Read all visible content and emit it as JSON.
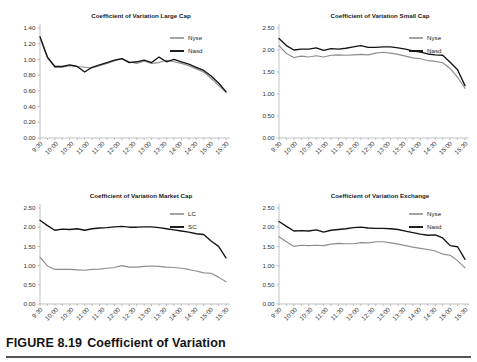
{
  "figure": {
    "caption_label": "FIGURE 8.19",
    "caption_title": "Coefficient of Variation"
  },
  "common": {
    "x_tick_labels": [
      "9:30",
      "10:00",
      "10:30",
      "11:00",
      "11:30",
      "12:00",
      "12:30",
      "13:00",
      "13:30",
      "14:00",
      "14:30",
      "15:00",
      "15:30"
    ],
    "colors": {
      "gray_series": "#8d8d8d",
      "black_series": "#141414",
      "axis": "#9a9a9a",
      "text": "#1a1a1a",
      "rule": "#555555"
    }
  },
  "chart_data": [
    {
      "id": "large-cap",
      "type": "line",
      "title": "Coefficient of Variation Large Cap",
      "xlabel": "",
      "ylabel": "",
      "ylim": [
        0.0,
        1.4
      ],
      "ytick_labels": [
        "0.00",
        "0.20",
        "0.40",
        "0.60",
        "0.80",
        "1.00",
        "1.20",
        "1.40"
      ],
      "ytick_values": [
        0.0,
        0.2,
        0.4,
        0.6,
        0.8,
        1.0,
        1.2,
        1.4
      ],
      "grid": false,
      "legend_position": "top-right",
      "x": [
        "9:30",
        "9:45",
        "10:00",
        "10:15",
        "10:30",
        "10:45",
        "11:00",
        "11:15",
        "11:30",
        "11:45",
        "12:00",
        "12:15",
        "12:30",
        "12:45",
        "13:00",
        "13:15",
        "13:30",
        "13:45",
        "14:00",
        "14:15",
        "14:30",
        "14:45",
        "15:00",
        "15:15",
        "15:30",
        "15:45"
      ],
      "series": [
        {
          "name": "Nyse",
          "color": "#8d8d8d",
          "values": [
            1.27,
            1.02,
            0.9,
            0.9,
            0.92,
            0.91,
            0.9,
            0.89,
            0.92,
            0.95,
            0.98,
            1.01,
            0.97,
            0.95,
            0.98,
            0.95,
            0.96,
            0.99,
            0.97,
            0.95,
            0.92,
            0.88,
            0.84,
            0.76,
            0.67,
            0.58
          ]
        },
        {
          "name": "Nasd",
          "color": "#141414",
          "values": [
            1.29,
            1.03,
            0.91,
            0.91,
            0.93,
            0.91,
            0.84,
            0.9,
            0.93,
            0.96,
            0.99,
            1.01,
            0.96,
            0.97,
            0.99,
            0.96,
            1.03,
            0.97,
            1.0,
            0.97,
            0.94,
            0.9,
            0.86,
            0.79,
            0.7,
            0.59
          ]
        }
      ]
    },
    {
      "id": "small-cap",
      "type": "line",
      "title": "Coefficient of Variation Small Cap",
      "xlabel": "",
      "ylabel": "",
      "ylim": [
        0.0,
        2.5
      ],
      "ytick_labels": [
        "0.00",
        "0.50",
        "1.00",
        "1.50",
        "2.00",
        "2.50"
      ],
      "ytick_values": [
        0.0,
        0.5,
        1.0,
        1.5,
        2.0,
        2.5
      ],
      "grid": false,
      "legend_position": "top-right",
      "x": [
        "9:30",
        "9:45",
        "10:00",
        "10:15",
        "10:30",
        "10:45",
        "11:00",
        "11:15",
        "11:30",
        "11:45",
        "12:00",
        "12:15",
        "12:30",
        "12:45",
        "13:00",
        "13:15",
        "13:30",
        "13:45",
        "14:00",
        "14:15",
        "14:30",
        "14:45",
        "15:00",
        "15:15",
        "15:30",
        "15:45"
      ],
      "series": [
        {
          "name": "Nyse",
          "color": "#8d8d8d",
          "values": [
            2.1,
            1.92,
            1.83,
            1.86,
            1.84,
            1.87,
            1.84,
            1.88,
            1.89,
            1.88,
            1.89,
            1.9,
            1.89,
            1.93,
            1.95,
            1.93,
            1.9,
            1.86,
            1.82,
            1.8,
            1.76,
            1.74,
            1.71,
            1.58,
            1.38,
            1.13
          ]
        },
        {
          "name": "Nasd",
          "color": "#141414",
          "values": [
            2.26,
            2.1,
            2.0,
            2.02,
            2.02,
            2.05,
            1.99,
            2.03,
            2.02,
            2.04,
            2.07,
            2.1,
            2.06,
            2.06,
            2.07,
            2.07,
            2.05,
            2.02,
            1.98,
            1.95,
            1.91,
            1.89,
            1.88,
            1.72,
            1.55,
            1.19
          ]
        }
      ]
    },
    {
      "id": "market-cap",
      "type": "line",
      "title": "Coefficient of Variation Market Cap",
      "xlabel": "",
      "ylabel": "",
      "ylim": [
        0.0,
        2.5
      ],
      "ytick_labels": [
        "0.00",
        "0.50",
        "1.00",
        "1.50",
        "2.00",
        "2.50"
      ],
      "ytick_values": [
        0.0,
        0.5,
        1.0,
        1.5,
        2.0,
        2.5
      ],
      "grid": false,
      "legend_position": "top-right",
      "x": [
        "9:30",
        "9:45",
        "10:00",
        "10:15",
        "10:30",
        "10:45",
        "11:00",
        "11:15",
        "11:30",
        "11:45",
        "12:00",
        "12:15",
        "12:30",
        "12:45",
        "13:00",
        "13:15",
        "13:30",
        "13:45",
        "14:00",
        "14:15",
        "14:30",
        "14:45",
        "15:00",
        "15:15",
        "15:30",
        "15:45"
      ],
      "series": [
        {
          "name": "LC",
          "color": "#8d8d8d",
          "values": [
            1.22,
            0.99,
            0.9,
            0.9,
            0.9,
            0.89,
            0.88,
            0.9,
            0.91,
            0.93,
            0.95,
            1.0,
            0.96,
            0.96,
            0.98,
            0.99,
            0.98,
            0.96,
            0.95,
            0.93,
            0.9,
            0.86,
            0.81,
            0.8,
            0.7,
            0.58
          ]
        },
        {
          "name": "SC",
          "color": "#141414",
          "values": [
            2.18,
            2.04,
            1.92,
            1.95,
            1.94,
            1.96,
            1.92,
            1.96,
            1.98,
            1.99,
            2.01,
            2.02,
            2.0,
            2.0,
            2.01,
            2.01,
            1.99,
            1.96,
            1.93,
            1.9,
            1.87,
            1.83,
            1.81,
            1.64,
            1.5,
            1.2
          ]
        }
      ]
    },
    {
      "id": "exchange",
      "type": "line",
      "title": "Coefficient of Variation Exchange",
      "xlabel": "",
      "ylabel": "",
      "ylim": [
        0.0,
        2.5
      ],
      "ytick_labels": [
        "0.00",
        "0.50",
        "1.00",
        "1.50",
        "2.00",
        "2.50"
      ],
      "ytick_values": [
        0.0,
        0.5,
        1.0,
        1.5,
        2.0,
        2.5
      ],
      "grid": false,
      "legend_position": "top-right",
      "x": [
        "9:30",
        "9:45",
        "10:00",
        "10:15",
        "10:30",
        "10:45",
        "11:00",
        "11:15",
        "11:30",
        "11:45",
        "12:00",
        "12:15",
        "12:30",
        "12:45",
        "13:00",
        "13:15",
        "13:30",
        "13:45",
        "14:00",
        "14:15",
        "14:30",
        "14:45",
        "15:00",
        "15:15",
        "15:30",
        "15:45"
      ],
      "series": [
        {
          "name": "Nyse",
          "color": "#8d8d8d",
          "values": [
            1.75,
            1.62,
            1.5,
            1.53,
            1.52,
            1.53,
            1.52,
            1.56,
            1.58,
            1.57,
            1.57,
            1.6,
            1.59,
            1.62,
            1.62,
            1.59,
            1.56,
            1.52,
            1.48,
            1.45,
            1.42,
            1.38,
            1.3,
            1.27,
            1.13,
            0.94
          ]
        },
        {
          "name": "Nasd",
          "color": "#141414",
          "values": [
            2.15,
            2.02,
            1.9,
            1.91,
            1.9,
            1.93,
            1.87,
            1.92,
            1.94,
            1.96,
            1.99,
            2.0,
            1.98,
            1.97,
            1.97,
            1.96,
            1.94,
            1.9,
            1.86,
            1.82,
            1.79,
            1.8,
            1.72,
            1.52,
            1.49,
            1.16
          ]
        }
      ]
    }
  ]
}
